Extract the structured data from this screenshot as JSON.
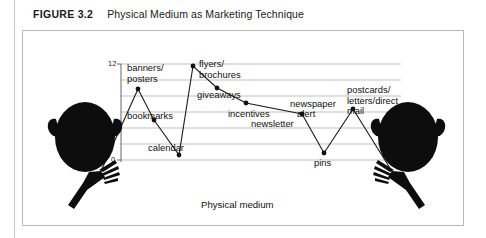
{
  "caption": {
    "figure_label": "FIGURE 3.2",
    "title": "Physical Medium as Marketing Technique"
  },
  "chart_data": {
    "type": "line",
    "title": "Physical Medium as Marketing Technique",
    "xlabel": "Physical medium",
    "ylabel": "",
    "ylim": [
      0,
      12
    ],
    "ytick_labels": [
      "0",
      "12"
    ],
    "grid": true,
    "gridlines": 7,
    "legend": "none",
    "categories": [
      "banners/posters",
      "bookmarks",
      "calendar",
      "flyers/brochures",
      "giveaways",
      "incentives",
      "newsletter",
      "pins",
      "postcards/letters/direct mail"
    ],
    "values": [
      9.2,
      6.2,
      0.6,
      12,
      9.3,
      7.6,
      6.3,
      1.1,
      6.7
    ],
    "points": [
      {
        "label": "banners/posters",
        "x": 137,
        "y": 88,
        "value": 9.2,
        "label_lines": [
          "banners/",
          "posters"
        ],
        "label_x": 126,
        "label_y": 62,
        "label_align": "left"
      },
      {
        "label": "bookmarks",
        "x": 153,
        "y": 119,
        "value": 6.2,
        "label_lines": [
          "bookmarks"
        ],
        "label_x": 126,
        "label_y": 110,
        "label_align": "left"
      },
      {
        "label": "calendar",
        "x": 178,
        "y": 154,
        "value": 0.6,
        "label_lines": [
          "calendar"
        ],
        "label_x": 147,
        "label_y": 142,
        "label_align": "left"
      },
      {
        "label": "flyers/brochures",
        "x": 192,
        "y": 65,
        "value": 12.0,
        "label_lines": [
          "flyers/",
          "brochures"
        ],
        "label_x": 198,
        "label_y": 58,
        "label_align": "left"
      },
      {
        "label": "giveaways",
        "x": 216,
        "y": 87,
        "value": 9.3,
        "label_lines": [
          "giveaways"
        ],
        "label_x": 196,
        "label_y": 89,
        "label_align": "left"
      },
      {
        "label": "incentives",
        "x": 245,
        "y": 102,
        "value": 7.6,
        "label_lines": [
          "incentives"
        ],
        "label_x": 227,
        "label_y": 108,
        "label_align": "left"
      },
      {
        "label": "newsletter",
        "x": 301,
        "y": 113,
        "value": 6.3,
        "label_lines": [
          "newsletter"
        ],
        "label_x": 250,
        "label_y": 118,
        "label_align": "left"
      },
      {
        "label": "pins",
        "x": 323,
        "y": 152,
        "value": 1.1,
        "label_lines": [
          "pins"
        ],
        "label_x": 313,
        "label_y": 157,
        "label_align": "left"
      },
      {
        "label": "postcards/letters/direct mail",
        "x": 352,
        "y": 108,
        "value": 6.7,
        "label_lines": [
          "postcards/",
          "letters/direct",
          "mail"
        ],
        "label_x": 346,
        "label_y": 84,
        "label_align": "left"
      }
    ],
    "extra_labels": [
      {
        "text": "newspaper",
        "x": 289,
        "y": 98
      },
      {
        "text": "alert",
        "x": 296,
        "y": 108
      }
    ]
  },
  "figures": {
    "left_person": "person-silhouette",
    "right_person": "person-silhouette"
  }
}
